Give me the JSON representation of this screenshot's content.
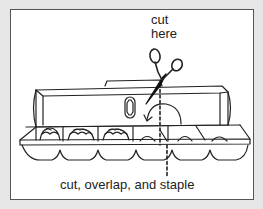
{
  "diagram": {
    "labels": {
      "cut_here_line1": "cut",
      "cut_here_line2": "here",
      "bottom_caption": "cut, overlap, and staple"
    },
    "elements": {
      "scissors": "scissors-icon",
      "carton": "egg-carton",
      "cut_line": "dashed-cut-line",
      "fold_arrow": "curved-fold-arrow",
      "eggs_filled_cups": 3,
      "empty_cups": 3
    },
    "colors": {
      "background": "#e6e6e6",
      "frame": "#ffffff",
      "frame_border": "#555555",
      "ink": "#222222"
    }
  }
}
